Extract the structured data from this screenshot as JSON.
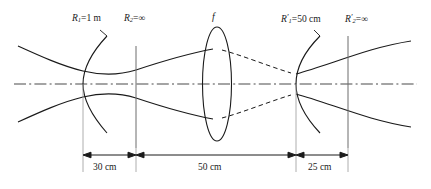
{
  "figure": {
    "type": "optical-resonator-diagram",
    "background": "#ffffff",
    "stroke_color": "#1a1a1a",
    "axis_color": "#4a4a4a",
    "width": 431,
    "height": 189
  },
  "labels": {
    "r1": {
      "symbol": "R",
      "subscript": "1",
      "prime": "",
      "eq": "=1 m",
      "full": "R1=1 m"
    },
    "r2": {
      "symbol": "R",
      "subscript": "2",
      "prime": "",
      "eq": "=∞",
      "full": "R2=∞"
    },
    "focal": {
      "text": "f"
    },
    "r1p": {
      "symbol": "R",
      "subscript": "1",
      "prime": "′",
      "eq": "=50 cm",
      "full": "R′1=50 cm"
    },
    "r2p": {
      "symbol": "R",
      "subscript": "2",
      "prime": "′",
      "eq": "=∞",
      "full": "R′2=∞"
    }
  },
  "dimensions": [
    {
      "name": "left-arm",
      "label": "30 cm",
      "value": 30,
      "unit": "cm"
    },
    {
      "name": "center-arm",
      "label": "50 cm",
      "value": 50,
      "unit": "cm"
    },
    {
      "name": "right-arm",
      "label": "25 cm",
      "value": 25,
      "unit": "cm"
    }
  ],
  "elements": [
    {
      "name": "curved-mirror-left",
      "kind": "concave-mirror",
      "radius_label": "R1=1 m"
    },
    {
      "name": "flat-mirror-left",
      "kind": "flat-mirror",
      "radius_label": "R2=∞"
    },
    {
      "name": "lens",
      "kind": "converging-lens",
      "focal_label": "f"
    },
    {
      "name": "curved-mirror-right",
      "kind": "concave-mirror",
      "radius_label": "R′1=50 cm"
    },
    {
      "name": "flat-mirror-right",
      "kind": "flat-mirror",
      "radius_label": "R′2=∞"
    }
  ],
  "beam": {
    "solid_style": "solid",
    "virtual_style": "dashed",
    "axis_style": "dash-dot"
  }
}
